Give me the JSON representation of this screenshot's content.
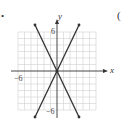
{
  "marker": "•",
  "paren": "(",
  "graph": {
    "x_axis_label": "x",
    "y_axis_label": "y",
    "tick_labels": {
      "y_top": "6",
      "y_bottom": "−6",
      "x_left": "−6"
    },
    "lines": [
      {
        "equation": "y = 2x",
        "slope": 2
      },
      {
        "equation": "y = −2x",
        "slope": -2
      }
    ],
    "range": {
      "x": [
        -6,
        6
      ],
      "y": [
        -6,
        6
      ]
    },
    "colors": {
      "grid": "#d0d0d0",
      "axis": "#333333",
      "line": "#333333"
    }
  }
}
